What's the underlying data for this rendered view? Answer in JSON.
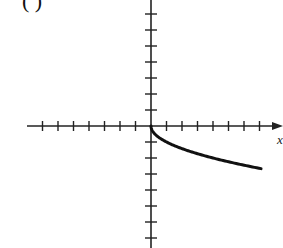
{
  "chart_data": {
    "type": "line",
    "title": "",
    "panel_label": "( )",
    "xlabel": "x",
    "ylabel": "",
    "function": "y = -sqrt(x)",
    "xlim": [
      -8,
      8.3
    ],
    "ylim": [
      -7.7,
      7.9
    ],
    "x_ticks": [
      -7,
      -6,
      -5,
      -4,
      -3,
      -2,
      -1,
      1,
      2,
      3,
      4,
      5,
      6,
      7
    ],
    "y_ticks": [
      -7,
      -6,
      -5,
      -4,
      -3,
      -2,
      -1,
      1,
      2,
      3,
      4,
      5,
      6,
      7
    ],
    "tick_labels_shown": false,
    "grid": false,
    "series": [
      {
        "name": "curve",
        "x": [
          0,
          0.25,
          1,
          2,
          3,
          4,
          5,
          6,
          7.1
        ],
        "y": [
          0,
          -0.5,
          -1,
          -1.41,
          -1.73,
          -2,
          -2.24,
          -2.45,
          -2.66
        ]
      }
    ],
    "colors": {
      "axis": "#222222",
      "curve": "#111111",
      "background": "#ffffff"
    }
  }
}
